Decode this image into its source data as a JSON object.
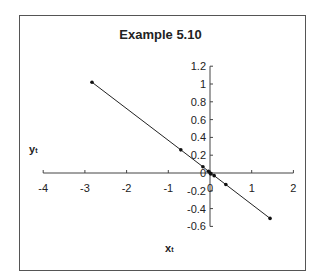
{
  "chart_data": {
    "type": "line",
    "title": "Example 5.10",
    "xlabel": "x",
    "xlabel_sub": "t",
    "ylabel": "y",
    "ylabel_sub": "t",
    "xlim": [
      -4,
      2
    ],
    "ylim": [
      -0.6,
      1.2
    ],
    "x_ticks": [
      "-4",
      "-3",
      "-2",
      "-1",
      "0",
      "1",
      "2"
    ],
    "y_ticks": [
      "1.2",
      "1",
      "0.8",
      "0.6",
      "0.4",
      "0.2",
      "0",
      "-0.2",
      "-0.4",
      "-0.6"
    ],
    "grid": false,
    "legend": null,
    "series": [
      {
        "name": "y_t vs x_t",
        "x": [
          -2.83,
          -0.7,
          -0.17,
          -0.04,
          0.0,
          0.02,
          0.1,
          0.38,
          1.44
        ],
        "y": [
          1.02,
          0.26,
          0.07,
          0.02,
          0.0,
          -0.01,
          -0.03,
          -0.13,
          -0.51
        ]
      }
    ]
  }
}
